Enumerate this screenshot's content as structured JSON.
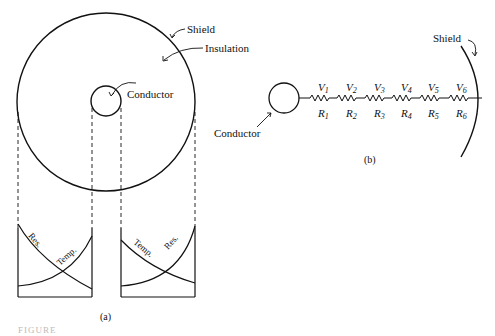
{
  "figure": {
    "panel_a": {
      "caption": "(a)",
      "labels": {
        "shield": "Shield",
        "insulation": "Insulation",
        "conductor": "Conductor"
      },
      "graphs": [
        {
          "name": "left-graph",
          "curves": [
            "Res.",
            "Temp."
          ]
        },
        {
          "name": "right-graph",
          "curves": [
            "Temp.",
            "Res."
          ]
        }
      ]
    },
    "panel_b": {
      "caption": "(b)",
      "labels": {
        "shield": "Shield",
        "conductor": "Conductor"
      },
      "voltages": [
        "V",
        "V",
        "V",
        "V",
        "V",
        "V"
      ],
      "voltage_subs": [
        "1",
        "2",
        "3",
        "4",
        "5",
        "6"
      ],
      "resistors": [
        "R",
        "R",
        "R",
        "R",
        "R",
        "R"
      ],
      "resistor_subs": [
        "1",
        "2",
        "3",
        "4",
        "5",
        "6"
      ]
    },
    "footer_label": "FIGURE"
  }
}
